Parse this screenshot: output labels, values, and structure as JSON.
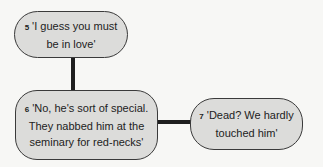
{
  "nodes": [
    {
      "number": "5",
      "text": "'I guess you must\nbe in love'"
    },
    {
      "number": "6",
      "text": "'No, he's sort of special.\nThey nabbed him at the\nseminary for red-necks'"
    },
    {
      "number": "7",
      "text": "'Dead? We hardly\ntouched him'"
    }
  ],
  "edges": [
    {
      "from": "5",
      "to": "6"
    },
    {
      "from": "6",
      "to": "7"
    }
  ]
}
